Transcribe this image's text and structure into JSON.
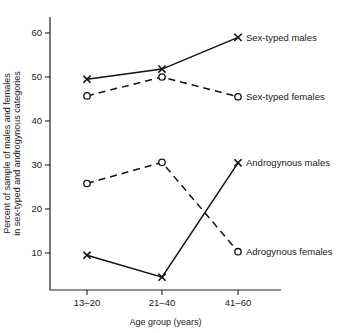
{
  "chart_data": {
    "type": "line",
    "title": "",
    "xlabel": "Age group (years)",
    "ylabel": "Percent of sample of males and females in sex-typed and androgynous categories",
    "ylabel_line1": "Percent of sample of males and females",
    "ylabel_line2": "in sex-typed and androgynous categories",
    "categories": [
      "13–20",
      "21–40",
      "41–60"
    ],
    "yticks": [
      10,
      20,
      30,
      40,
      50,
      60
    ],
    "ytick_labels": [
      "10",
      "20",
      "30",
      "40",
      "50",
      "60"
    ],
    "ylim": [
      3,
      63
    ],
    "grid": false,
    "legend_position": "inline-right",
    "series": [
      {
        "name": "Sex-typed males",
        "label": "Sex-typed males",
        "marker": "x",
        "linestyle": "solid",
        "color": "#111111",
        "values": [
          49.5,
          51.8,
          59.0
        ]
      },
      {
        "name": "Sex-typed females",
        "label": "Sex-typed females",
        "marker": "o",
        "linestyle": "dashed",
        "color": "#111111",
        "values": [
          45.7,
          50.0,
          45.5
        ]
      },
      {
        "name": "Androgynous males",
        "label": "Androgynous males",
        "marker": "x",
        "linestyle": "solid",
        "color": "#111111",
        "values": [
          9.5,
          4.5,
          30.5
        ]
      },
      {
        "name": "Adrogynous females",
        "label": "Adrogynous females",
        "marker": "o",
        "linestyle": "dashed",
        "color": "#111111",
        "values": [
          25.8,
          30.6,
          10.3
        ]
      }
    ]
  }
}
